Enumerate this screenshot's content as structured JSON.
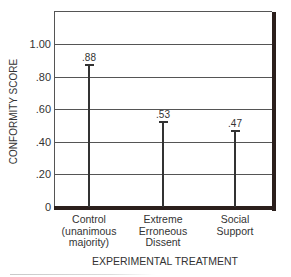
{
  "chart_data": {
    "type": "bar",
    "style": "lollipop-style thin bars with cap and value label",
    "title": "",
    "xlabel": "EXPERIMENTAL TREATMENT",
    "ylabel": "CONFORMITY SCORE",
    "categories": [
      "Control (unanimous majority)",
      "Extreme Erroneous Dissent",
      "Social Support"
    ],
    "category_lines": [
      [
        "Control",
        "(unanimous",
        "majority)"
      ],
      [
        "Extreme",
        "Erroneous",
        "Dissent"
      ],
      [
        "Social",
        "Support"
      ]
    ],
    "values": [
      0.88,
      0.53,
      0.47
    ],
    "value_labels": [
      ".88",
      ".53",
      ".47"
    ],
    "yticks": [
      0,
      0.2,
      0.4,
      0.6,
      0.8,
      1.0
    ],
    "ytick_labels": [
      "0",
      ".20",
      ".40",
      ".60",
      ".80",
      "1.00"
    ],
    "ylim": [
      0,
      1.2
    ],
    "grid": true,
    "legend": null
  },
  "colors": {
    "bar": "#333333",
    "grid": "#555555",
    "frame_shadow": "#2b1f1c",
    "background": "#ffffff"
  }
}
